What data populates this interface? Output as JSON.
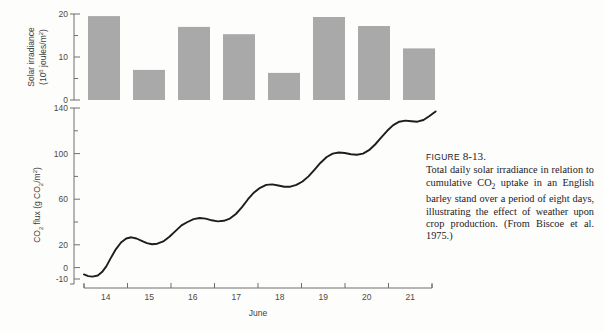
{
  "figure": {
    "label_prefix": "Figure",
    "number": "8-13.",
    "caption": "Total daily solar irradiance in relation to cumulative CO2 uptake in an English barley stand over a period of eight days, illustrating the effect of weather upon crop production. (From Biscoe et al. 1975.)"
  },
  "chart_data": [
    {
      "type": "bar",
      "title": "",
      "xlabel": "June",
      "ylabel": "Solar irradiance (10^6 joules/m^2)",
      "ylabel_main": "Solar irradiance",
      "ylabel_unit_pre": "(10",
      "ylabel_unit_sup": "6",
      "ylabel_unit_post": " joules/m",
      "ylabel_unit_sup2": "2",
      "ylabel_unit_end": ")",
      "categories": [
        "14",
        "15",
        "16",
        "17",
        "18",
        "19",
        "20",
        "21"
      ],
      "values": [
        19.5,
        7.0,
        17.0,
        15.3,
        6.3,
        19.3,
        17.2,
        12.0
      ],
      "ylim": [
        0,
        20
      ],
      "yticks": [
        0,
        10,
        20
      ],
      "ytick_labels": [
        "0",
        "10",
        "20"
      ],
      "yminor": [
        5,
        15
      ],
      "grid": false,
      "bar_color": "#a9a9a9"
    },
    {
      "type": "line",
      "title": "",
      "xlabel": "June",
      "ylabel": "CO2 flux (g CO2/m^2)",
      "ylabel_pre": "CO",
      "ylabel_sub": "2",
      "ylabel_mid": " flux (g CO",
      "ylabel_sub2": "2",
      "ylabel_end": "/m",
      "ylabel_sup": "2",
      "ylabel_close": ")",
      "ylim": [
        -10,
        140
      ],
      "yticks": [
        -10,
        0,
        20,
        40,
        60,
        80,
        100,
        120,
        140
      ],
      "ytick_labeled": [
        -10,
        0,
        20,
        60,
        100,
        140
      ],
      "ytick_labels": [
        "-10",
        "0",
        "20",
        "60",
        "100",
        "140"
      ],
      "xlim": [
        13.5,
        21.9
      ],
      "xticks": [
        "14",
        "15",
        "16",
        "17",
        "18",
        "19",
        "20",
        "21"
      ],
      "grid": false,
      "line_color": "#1d1d1d",
      "x": [
        13.6,
        13.7,
        13.8,
        13.92,
        14.02,
        14.12,
        14.22,
        14.34,
        14.46,
        14.58,
        14.7,
        14.82,
        14.94,
        15.06,
        15.18,
        15.3,
        15.44,
        15.58,
        15.72,
        15.86,
        16.0,
        16.14,
        16.28,
        16.42,
        16.56,
        16.7,
        16.84,
        16.98,
        17.12,
        17.26,
        17.4,
        17.54,
        17.68,
        17.82,
        17.96,
        18.1,
        18.24,
        18.38,
        18.52,
        18.66,
        18.8,
        18.94,
        19.08,
        19.22,
        19.36,
        19.5,
        19.64,
        19.78,
        19.92,
        20.06,
        20.2,
        20.34,
        20.48,
        20.62,
        20.76,
        20.9,
        21.04,
        21.18,
        21.32,
        21.46,
        21.6,
        21.74
      ],
      "y": [
        -6.0,
        -7.5,
        -8.0,
        -7.0,
        -4.0,
        1.0,
        8.0,
        16.0,
        22.0,
        25.5,
        26.5,
        25.5,
        23.5,
        21.5,
        20.5,
        21.0,
        23.0,
        27.0,
        32.0,
        37.0,
        40.0,
        42.5,
        43.5,
        43.0,
        41.5,
        40.5,
        41.0,
        43.0,
        47.0,
        53.0,
        60.0,
        66.0,
        70.0,
        72.5,
        73.0,
        72.0,
        71.0,
        71.0,
        72.5,
        75.5,
        80.0,
        86.0,
        92.0,
        97.0,
        100.0,
        101.0,
        100.5,
        99.5,
        99.0,
        100.0,
        103.0,
        108.0,
        114.0,
        120.0,
        125.0,
        128.0,
        129.0,
        128.5,
        128.0,
        129.5,
        133.0,
        137.0
      ]
    }
  ]
}
